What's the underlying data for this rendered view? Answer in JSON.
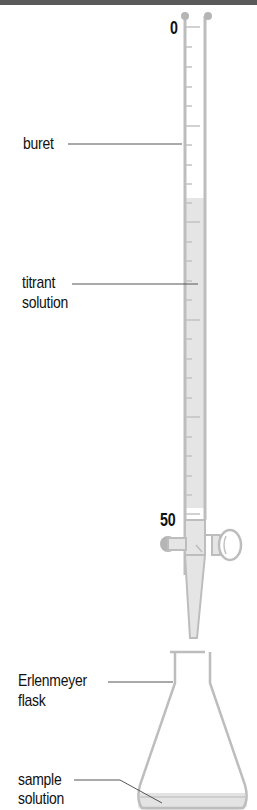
{
  "diagram": {
    "scale": {
      "top_mark": "0",
      "bottom_mark": "50"
    },
    "labels": {
      "buret": "buret",
      "titrant_line1": "titrant",
      "titrant_line2": "solution",
      "flask_line1": "Erlenmeyer",
      "flask_line2": "flask",
      "sample_line1": "sample",
      "sample_line2": "solution"
    },
    "colors": {
      "glass": "#b9b9b9",
      "liquid": "#e3e3e3",
      "leader": "#555555",
      "text": "#111111"
    }
  }
}
